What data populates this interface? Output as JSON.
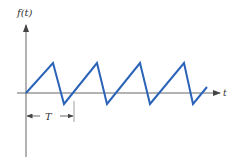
{
  "diagram": {
    "type": "sawtooth-waveform",
    "y_axis_label": "f(t)",
    "x_axis_label": "t",
    "period_label": "T",
    "waveform_color": "#2a63b8",
    "axis_color": "#555555",
    "points": [
      [
        26,
        93
      ],
      [
        53,
        63
      ],
      [
        64,
        104
      ],
      [
        97,
        63
      ],
      [
        107,
        104
      ],
      [
        140,
        63
      ],
      [
        150,
        104
      ],
      [
        184,
        63
      ],
      [
        193,
        104
      ],
      [
        207,
        87
      ]
    ]
  }
}
